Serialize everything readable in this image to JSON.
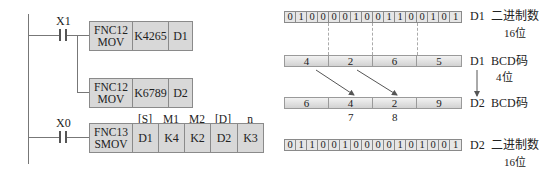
{
  "ladder": {
    "rung1": {
      "contact": "X1",
      "instr1": {
        "fnc": "FNC12",
        "mnemonic": "MOV",
        "source": "K4265",
        "dest": "D1"
      },
      "instr2": {
        "fnc": "FNC12",
        "mnemonic": "MOV",
        "source": "K6789",
        "dest": "D2"
      }
    },
    "rung2": {
      "contact": "X0",
      "instr": {
        "fnc": "FNC13",
        "mnemonic": "SMOV",
        "operand_labels": [
          "[S]",
          "M1",
          "M2",
          "[D]",
          "n"
        ],
        "operands": [
          "D1",
          "K4",
          "K2",
          "D2",
          "K3"
        ]
      }
    }
  },
  "diagram": {
    "d1_binary": {
      "bits": [
        "0",
        "1",
        "0",
        "0",
        "0",
        "0",
        "1",
        "0",
        "0",
        "1",
        "1",
        "0",
        "0",
        "1",
        "0",
        "1"
      ],
      "reg": "D1",
      "desc": "二进制数",
      "sub": "16位"
    },
    "d1_bcd": {
      "digits": [
        "4",
        "2",
        "6",
        "5"
      ],
      "reg": "D1",
      "desc": "BCD码",
      "sub": "4位"
    },
    "d2_bcd": {
      "digits": [
        "6",
        "4",
        "2",
        "9"
      ],
      "reg": "D2",
      "desc": "BCD码",
      "replaced": [
        "7",
        "8"
      ]
    },
    "d2_binary": {
      "bits": [
        "0",
        "1",
        "1",
        "0",
        "0",
        "1",
        "0",
        "0",
        "0",
        "0",
        "1",
        "0",
        "1",
        "0",
        "0",
        "1"
      ],
      "reg": "D2",
      "desc": "二进制数",
      "sub": "16位"
    }
  }
}
